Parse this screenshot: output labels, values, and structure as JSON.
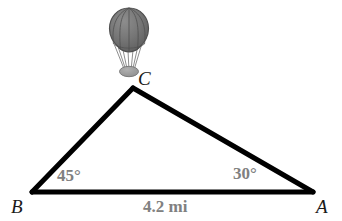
{
  "figure": {
    "type": "geometry-diagram",
    "background_color": "#ffffff",
    "stroke_color": "#000000",
    "label_gray": "#808080",
    "vertex_label_color": "#1a1a1a",
    "balloon": {
      "icon_name": "hot-air-balloon-icon",
      "envelope_color": "#6f6f6f",
      "envelope_outline_color": "#4a4a4a",
      "basket_color": "#9a9a9a",
      "rope_color": "#8a8a8a"
    },
    "triangle": {
      "vertices": [
        {
          "name": "C",
          "label": "C",
          "x": 133,
          "y": 88
        },
        {
          "name": "B",
          "label": "B",
          "x": 32,
          "y": 192
        },
        {
          "name": "A",
          "label": "A",
          "x": 313,
          "y": 192
        }
      ],
      "line_width": 5
    },
    "angles": [
      {
        "at": "B",
        "label": "45°",
        "value": 45,
        "unit": "degrees"
      },
      {
        "at": "A",
        "label": "30°",
        "value": 30,
        "unit": "degrees"
      }
    ],
    "sides": [
      {
        "from": "B",
        "to": "A",
        "label": "4.2 mi",
        "value": 4.2,
        "unit": "mi"
      }
    ]
  }
}
